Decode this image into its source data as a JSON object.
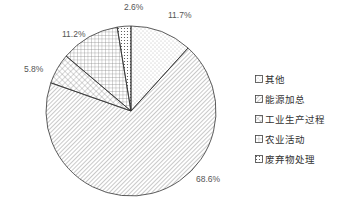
{
  "chart_data": {
    "type": "pie",
    "title": "",
    "start_angle_deg": 0,
    "direction": "clockwise",
    "slices": [
      {
        "label": "其他",
        "value": 11.7,
        "display": "11.7%",
        "pattern": "sparse-dots"
      },
      {
        "label": "能源加总",
        "value": 68.6,
        "display": "68.6%",
        "pattern": "diagonal-lines"
      },
      {
        "label": "工业生产过程",
        "value": 5.8,
        "display": "5.8%",
        "pattern": "diagonal-crosshatch"
      },
      {
        "label": "农业活动",
        "value": 11.2,
        "display": "11.2%",
        "pattern": "grid"
      },
      {
        "label": "废弃物处理",
        "value": 2.6,
        "display": "2.6%",
        "pattern": "dense-dots"
      }
    ],
    "legend_position": "right",
    "colors": {
      "stroke": "#333333",
      "pattern": "#666666",
      "background": "#ffffff"
    }
  },
  "legend": {
    "items": [
      "其他",
      "能源加总",
      "工业生产过程",
      "农业活动",
      "废弃物处理"
    ]
  }
}
